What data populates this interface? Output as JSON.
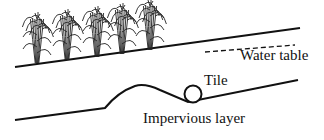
{
  "diagram": {
    "labels": {
      "water_table": "Water table",
      "tile": "Tile",
      "impervious_layer": "Impervious layer"
    },
    "plants": [
      {
        "x": 37,
        "base_y": 63
      },
      {
        "x": 67,
        "base_y": 60
      },
      {
        "x": 97,
        "base_y": 57
      },
      {
        "x": 122,
        "base_y": 54
      },
      {
        "x": 150,
        "base_y": 50
      }
    ],
    "colors": {
      "stroke": "#111111",
      "background": "#ffffff"
    }
  }
}
